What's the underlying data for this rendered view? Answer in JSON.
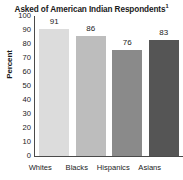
{
  "chart_data": {
    "type": "bar",
    "title": "Asked of American Indian Respondents",
    "title_superscript": "1",
    "categories": [
      "Whites",
      "Blacks",
      "Hispanics",
      "Asians"
    ],
    "values": [
      91,
      86,
      76,
      83
    ],
    "xlabel": "",
    "ylabel": "Percent",
    "ylim": [
      0,
      100
    ],
    "ytick_labels": [
      "100",
      "90",
      "80",
      "70",
      "60",
      "50",
      "40",
      "30",
      "20",
      "10",
      "0"
    ],
    "ytick_values": [
      100,
      90,
      80,
      70,
      60,
      50,
      40,
      30,
      20,
      10,
      0
    ],
    "grid": false,
    "legend": false,
    "data_labels": [
      "91",
      "86",
      "76",
      "83"
    ],
    "bar_colors": [
      "#dcdcdc",
      "#bdbdbd",
      "#8a8a8a",
      "#555555"
    ],
    "axis_color": "#4a4a4a",
    "background_color": "#ffffff",
    "text_color": "#1a1a1a"
  }
}
